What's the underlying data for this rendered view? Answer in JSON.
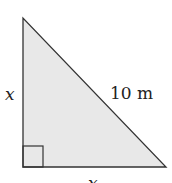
{
  "diagram": {
    "type": "right-triangle",
    "fill_color": "#e8e8e8",
    "stroke_color": "#333333",
    "labels": {
      "left_leg": "x",
      "hypotenuse": "10 m",
      "bottom_leg": "x"
    },
    "right_angle_marker": true
  }
}
